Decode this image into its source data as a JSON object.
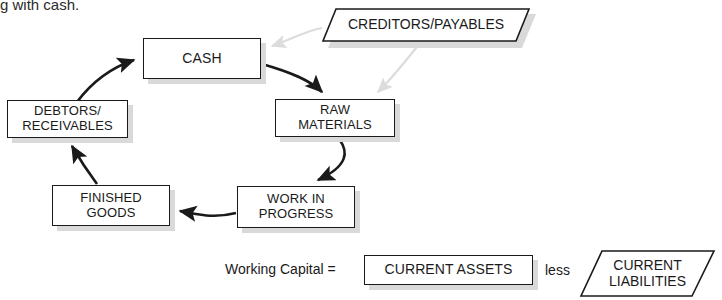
{
  "diagram": {
    "top_text": "g with cash.",
    "nodes": [
      {
        "id": "cash",
        "label": "CASH",
        "shape": "rect",
        "x": 143,
        "y": 38,
        "w": 118,
        "h": 41,
        "font": 14
      },
      {
        "id": "debtors",
        "label": "DEBTORS/\nRECEIVABLES",
        "shape": "rect",
        "x": 7,
        "y": 100,
        "w": 121,
        "h": 38,
        "font": 13
      },
      {
        "id": "raw_materials",
        "label": "RAW\nMATERIALS",
        "shape": "rect",
        "x": 275,
        "y": 99,
        "w": 120,
        "h": 38,
        "font": 13
      },
      {
        "id": "work_in_progress",
        "label": "WORK IN\nPROGRESS",
        "shape": "rect",
        "x": 237,
        "y": 186,
        "w": 118,
        "h": 42,
        "font": 13
      },
      {
        "id": "finished_goods",
        "label": "FINISHED\nGOODS",
        "shape": "rect",
        "x": 52,
        "y": 185,
        "w": 118,
        "h": 41,
        "font": 13
      },
      {
        "id": "creditors",
        "label": "CREDITORS/PAYABLES",
        "shape": "parallelogram",
        "x": 322,
        "y": 8,
        "w": 208,
        "h": 34,
        "skew": 14,
        "font": 14
      },
      {
        "id": "current_assets",
        "label": "CURRENT ASSETS",
        "shape": "rect",
        "x": 364,
        "y": 255,
        "w": 169,
        "h": 30,
        "font": 14
      },
      {
        "id": "current_liabilities",
        "label": "CURRENT\nLIABILITIES",
        "shape": "parallelogram",
        "x": 580,
        "y": 250,
        "w": 135,
        "h": 47,
        "skew": 22,
        "font": 14
      }
    ],
    "equation": {
      "lhs_label": "Working Capital =",
      "operator_label": "less"
    },
    "flow_arrows": [
      {
        "from": "debtors",
        "to": "cash",
        "color": "#1a1a1a"
      },
      {
        "from": "cash",
        "to": "raw_materials",
        "color": "#1a1a1a"
      },
      {
        "from": "raw_materials",
        "to": "work_in_progress",
        "color": "#1a1a1a"
      },
      {
        "from": "work_in_progress",
        "to": "finished_goods",
        "color": "#1a1a1a"
      },
      {
        "from": "finished_goods",
        "to": "debtors",
        "color": "#1a1a1a"
      },
      {
        "from": "creditors",
        "to": "cash",
        "color": "#dcdcdc"
      },
      {
        "from": "creditors",
        "to": "raw_materials",
        "color": "#dcdcdc"
      }
    ],
    "colors": {
      "line": "#1a1a1a",
      "faint_arrow": "#dcdcdc",
      "shadow": "#d9d9d9",
      "background": "#ffffff"
    }
  }
}
